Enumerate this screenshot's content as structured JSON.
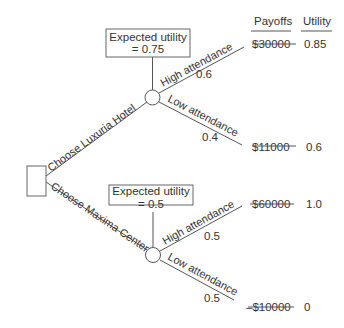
{
  "headers": {
    "payoffs": "Payoffs",
    "utility": "Utility"
  },
  "decision": {
    "options": [
      {
        "label": "Choose Luxuria Hotel",
        "expected_utility_title": "Expected utility",
        "expected_utility_value": "= 0.75",
        "outcomes": [
          {
            "label": "High attendance",
            "probability": "0.6",
            "payoff": "$30000",
            "utility": "0.85"
          },
          {
            "label": "Low attendance",
            "probability": "0.4",
            "payoff": "$11000",
            "utility": "0.6"
          }
        ]
      },
      {
        "label": "Choose Maxima Center",
        "expected_utility_title": "Expected utility",
        "expected_utility_value": "= 0.5",
        "outcomes": [
          {
            "label": "High attendance",
            "probability": "0.5",
            "payoff": "$60000",
            "utility": "1.0"
          },
          {
            "label": "Low attendance",
            "probability": "0.5",
            "payoff": "–$10000",
            "utility": "0"
          }
        ]
      }
    ]
  }
}
